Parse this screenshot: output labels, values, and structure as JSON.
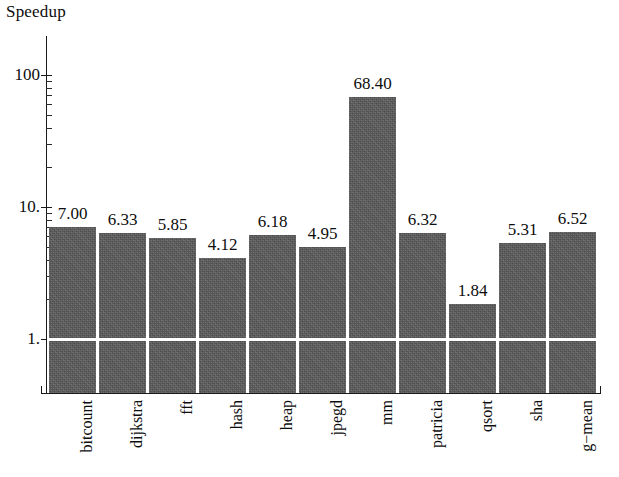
{
  "chart_data": {
    "type": "bar",
    "title": "",
    "ylabel": "Speedup",
    "xlabel": "",
    "yscale": "log",
    "ylim": [
      0.72,
      200
    ],
    "grid": false,
    "legend": null,
    "y_tick_labels": [
      "100",
      "10.",
      "1."
    ],
    "y_tick_values": [
      100,
      10,
      1
    ],
    "categories": [
      "bitcount",
      "dijkstra",
      "fft",
      "hash",
      "heap",
      "jpegd",
      "mm",
      "patricia",
      "qsort",
      "sha",
      "g−mean"
    ],
    "values": [
      7.0,
      6.33,
      5.85,
      4.12,
      6.18,
      4.95,
      68.4,
      6.32,
      1.84,
      5.31,
      6.52
    ],
    "value_labels": [
      "7.00",
      "6.33",
      "5.85",
      "4.12",
      "6.18",
      "4.95",
      "68.40",
      "6.32",
      "1.84",
      "5.31",
      "6.52"
    ],
    "bar_color": "#5b5b5b",
    "axis_color": "#1a1a1a",
    "background_color": "#ffffff"
  },
  "axis": {
    "y_title": "Speedup"
  }
}
